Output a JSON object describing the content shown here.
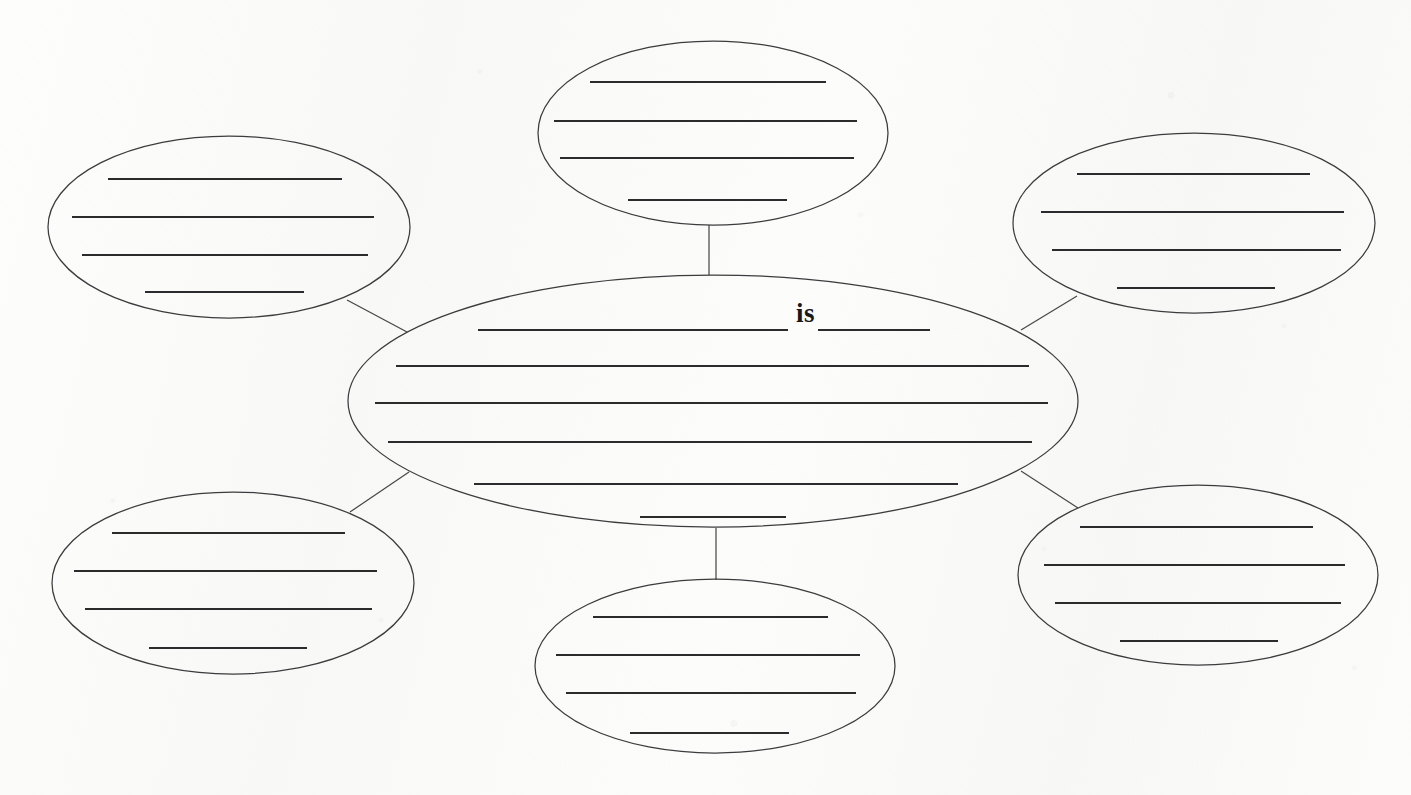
{
  "document": {
    "type": "concept-web-graphic-organizer",
    "orientation": "landscape",
    "page_width": 1411,
    "page_height": 795,
    "background_color": "#fbfbfa",
    "ink_color": "#2b2b2d",
    "outline_color": "#3c3c3e",
    "printed_text": [
      "is"
    ]
  },
  "center_node": {
    "name": "center-oval",
    "cx": 713,
    "cy": 401,
    "rx": 365,
    "ry": 126,
    "printed_word": "is",
    "printed_word_x": 796,
    "printed_word_y": 300,
    "write_lines": [
      {
        "x1": 478,
        "x2": 788,
        "y": 330,
        "note": "prompt line before the word is"
      },
      {
        "x1": 818,
        "x2": 930,
        "y": 330,
        "note": "short blank after the word is"
      },
      {
        "x1": 396,
        "x2": 1029,
        "y": 366
      },
      {
        "x1": 375,
        "x2": 1048,
        "y": 403
      },
      {
        "x1": 388,
        "x2": 1032,
        "y": 442
      },
      {
        "x1": 474,
        "x2": 958,
        "y": 484
      },
      {
        "x1": 640,
        "x2": 786,
        "y": 517
      }
    ]
  },
  "satellite_nodes": [
    {
      "name": "top-oval",
      "position": "top",
      "cx": 713,
      "cy": 133,
      "rx": 175,
      "ry": 92,
      "write_lines": [
        {
          "x1": 590,
          "x2": 826,
          "y": 82
        },
        {
          "x1": 554,
          "x2": 857,
          "y": 121
        },
        {
          "x1": 560,
          "x2": 854,
          "y": 158
        },
        {
          "x1": 628,
          "x2": 787,
          "y": 200
        }
      ]
    },
    {
      "name": "top-left-oval",
      "position": "top-left",
      "cx": 229,
      "cy": 227,
      "rx": 181,
      "ry": 91,
      "write_lines": [
        {
          "x1": 108,
          "x2": 342,
          "y": 179
        },
        {
          "x1": 72,
          "x2": 374,
          "y": 217
        },
        {
          "x1": 82,
          "x2": 368,
          "y": 255
        },
        {
          "x1": 145,
          "x2": 304,
          "y": 292
        }
      ]
    },
    {
      "name": "top-right-oval",
      "position": "top-right",
      "cx": 1194,
      "cy": 223,
      "rx": 181,
      "ry": 90,
      "write_lines": [
        {
          "x1": 1077,
          "x2": 1310,
          "y": 174
        },
        {
          "x1": 1041,
          "x2": 1344,
          "y": 212
        },
        {
          "x1": 1052,
          "x2": 1341,
          "y": 250
        },
        {
          "x1": 1117,
          "x2": 1275,
          "y": 288
        }
      ]
    },
    {
      "name": "bottom-left-oval",
      "position": "bottom-left",
      "cx": 233,
      "cy": 583,
      "rx": 181,
      "ry": 91,
      "write_lines": [
        {
          "x1": 112,
          "x2": 345,
          "y": 533
        },
        {
          "x1": 74,
          "x2": 377,
          "y": 571
        },
        {
          "x1": 85,
          "x2": 372,
          "y": 609
        },
        {
          "x1": 149,
          "x2": 307,
          "y": 648
        }
      ]
    },
    {
      "name": "bottom-right-oval",
      "position": "bottom-right",
      "cx": 1198,
      "cy": 575,
      "rx": 180,
      "ry": 90,
      "write_lines": [
        {
          "x1": 1080,
          "x2": 1313,
          "y": 527
        },
        {
          "x1": 1044,
          "x2": 1345,
          "y": 565
        },
        {
          "x1": 1055,
          "x2": 1341,
          "y": 603
        },
        {
          "x1": 1120,
          "x2": 1278,
          "y": 641
        }
      ]
    },
    {
      "name": "bottom-oval",
      "position": "bottom",
      "cx": 715,
      "cy": 666,
      "rx": 180,
      "ry": 87,
      "write_lines": [
        {
          "x1": 593,
          "x2": 828,
          "y": 617
        },
        {
          "x1": 556,
          "x2": 860,
          "y": 655
        },
        {
          "x1": 566,
          "x2": 856,
          "y": 693
        },
        {
          "x1": 630,
          "x2": 789,
          "y": 733
        }
      ]
    }
  ],
  "connectors": [
    {
      "name": "connector-center-to-top",
      "x1": 709,
      "y1": 275,
      "x2": 709,
      "y2": 225
    },
    {
      "name": "connector-center-to-bottom",
      "x1": 716,
      "y1": 528,
      "x2": 716,
      "y2": 580
    },
    {
      "name": "connector-center-to-top-left",
      "x1": 407,
      "y1": 332,
      "x2": 347,
      "y2": 300
    },
    {
      "name": "connector-center-to-top-right",
      "x1": 1021,
      "y1": 330,
      "x2": 1077,
      "y2": 296
    },
    {
      "name": "connector-center-to-bottom-left",
      "x1": 409,
      "y1": 472,
      "x2": 350,
      "y2": 512
    },
    {
      "name": "connector-center-to-bottom-right",
      "x1": 1021,
      "y1": 471,
      "x2": 1078,
      "y2": 508
    }
  ]
}
